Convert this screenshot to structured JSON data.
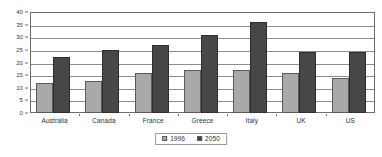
{
  "chart_data": {
    "type": "bar",
    "title": "",
    "subtitle": "",
    "xlabel": "",
    "ylabel": "",
    "categories": [
      "Australia",
      "Canada",
      "France",
      "Greece",
      "Italy",
      "UK",
      "US"
    ],
    "series": [
      {
        "name": "1996",
        "color": "#a9a9a9",
        "values": [
          12,
          12.5,
          16,
          17,
          17,
          16,
          14
        ]
      },
      {
        "name": "2050",
        "color": "#474747",
        "values": [
          22,
          25,
          27,
          31,
          36,
          24,
          24
        ]
      }
    ],
    "ylim": [
      0,
      40
    ],
    "ytick_step": 5,
    "yticks": [
      0,
      5,
      10,
      15,
      20,
      25,
      30,
      35,
      40
    ],
    "ytick_labels": [
      "0",
      "5",
      "10",
      "15",
      "20",
      "25",
      "30",
      "35",
      "40"
    ],
    "grid": true,
    "grid_axis": "y",
    "legend_position": "bottom-center",
    "legend_entries": [
      "1996",
      "2050"
    ],
    "plot_border_color": "#6e6e6e",
    "gridline_color": "#8c8c8c",
    "background_color": "#ffffff"
  }
}
